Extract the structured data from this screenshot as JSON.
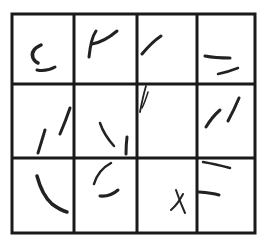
{
  "grid": {
    "rows": 3,
    "cols": 4,
    "line_color": "#1a1a1a",
    "stroke_color": "#222222",
    "x_lines": [
      12,
      74,
      137,
      197,
      255
    ],
    "y_lines": [
      14,
      84,
      158,
      233
    ]
  },
  "cells": [
    {
      "row": 0,
      "col": 0,
      "content": "curved C-shaped stroke with short horizontal stroke below"
    },
    {
      "row": 0,
      "col": 1,
      "content": "vertical stroke with arching stroke (P/μ-like)"
    },
    {
      "row": 0,
      "col": 2,
      "content": "single diagonal stroke"
    },
    {
      "row": 0,
      "col": 3,
      "content": "two short horizontal strokes"
    },
    {
      "row": 1,
      "col": 0,
      "content": "fuzzy short stroke and diagonal stroke"
    },
    {
      "row": 1,
      "col": 1,
      "content": "diagonal down-right stroke and short vertical stroke"
    },
    {
      "row": 1,
      "col": 2,
      "content": "thin double stroke at top-left"
    },
    {
      "row": 1,
      "col": 3,
      "content": "two diagonal strokes"
    },
    {
      "row": 2,
      "col": 0,
      "content": "long curved stroke"
    },
    {
      "row": 2,
      "col": 1,
      "content": "arc stroke with short curved stroke below"
    },
    {
      "row": 2,
      "col": 2,
      "content": "small X mark"
    },
    {
      "row": 2,
      "col": 3,
      "content": "two horizontal strokes"
    }
  ]
}
